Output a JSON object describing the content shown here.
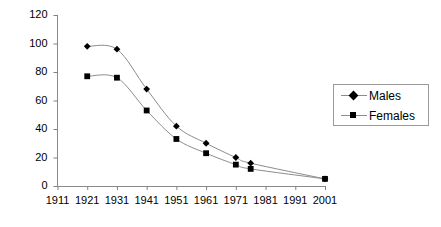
{
  "chart_data": {
    "type": "line",
    "title": "",
    "subtitle": "",
    "xlabel": "",
    "ylabel": "",
    "grid": false,
    "legend_position": "right",
    "xlim": [
      1911,
      2001
    ],
    "ylim": [
      0,
      120
    ],
    "x_tick_labels": [
      "1911",
      "1921",
      "1931",
      "1941",
      "1951",
      "1961",
      "1971",
      "1981",
      "1991",
      "2001"
    ],
    "y_tick_labels": [
      "0",
      "20",
      "40",
      "60",
      "80",
      "100",
      "120"
    ],
    "x": [
      1921,
      1931,
      1941,
      1951,
      1961,
      1971,
      1976,
      2001
    ],
    "series": [
      {
        "name": "Males",
        "marker": "diamond",
        "values": [
          98,
          96,
          68,
          42,
          30,
          20,
          16,
          5
        ]
      },
      {
        "name": "Females",
        "marker": "square",
        "values": [
          77,
          76,
          53,
          33,
          23,
          15,
          12,
          5
        ]
      }
    ],
    "colors": {
      "line": "#8c8c8c",
      "marker": "#000000",
      "axis": "#808080",
      "text": "#000000",
      "legend_border": "#9a9a9a",
      "background": "#ffffff"
    }
  },
  "legend": {
    "items": [
      {
        "label": "Males"
      },
      {
        "label": "Females"
      }
    ]
  }
}
